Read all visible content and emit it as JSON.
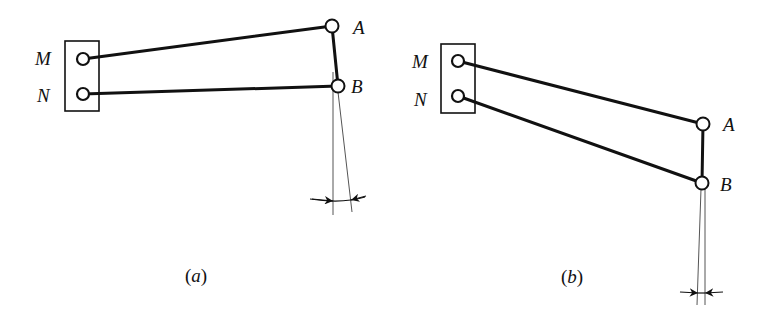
{
  "figures": [
    {
      "id": "a",
      "caption": "(a)",
      "caption_letter": "a",
      "labels": {
        "M": "M",
        "N": "N",
        "A": "A",
        "B": "B"
      },
      "points": {
        "M": [
          83,
          59
        ],
        "N": [
          83,
          94
        ],
        "A": [
          332,
          26
        ],
        "B": [
          338,
          86
        ]
      },
      "frame": {
        "x": 65,
        "y": 41,
        "w": 34,
        "h": 70
      },
      "guide_lines": [
        [
          [
            333,
            72
          ],
          [
            333,
            215
          ]
        ],
        [
          [
            338,
            92
          ],
          [
            352,
            212
          ]
        ]
      ],
      "dimension": {
        "y": 200,
        "x_left": 310,
        "x_right": 365
      }
    },
    {
      "id": "b",
      "caption": "(b)",
      "caption_letter": "b",
      "labels": {
        "M": "M",
        "N": "N",
        "A": "A",
        "B": "B"
      },
      "points": {
        "M": [
          458,
          61
        ],
        "N": [
          458,
          96
        ],
        "A": [
          703,
          124
        ],
        "B": [
          702,
          183
        ]
      },
      "frame": {
        "x": 441,
        "y": 44,
        "w": 34,
        "h": 69
      },
      "guide_lines": [
        [
          [
            702,
            189
          ],
          [
            697,
            305
          ]
        ],
        [
          [
            705,
            189
          ],
          [
            705,
            305
          ]
        ]
      ],
      "dimension": {
        "y": 293,
        "x_left": 680,
        "x_right": 722
      }
    }
  ]
}
